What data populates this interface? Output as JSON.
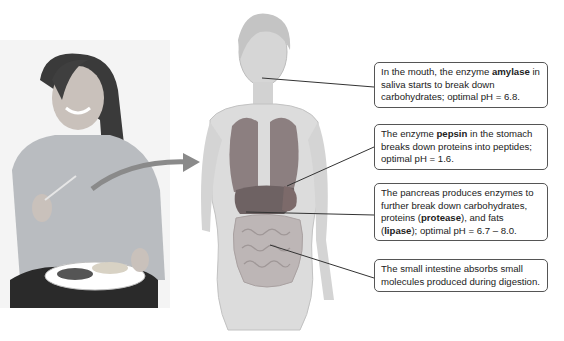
{
  "figure": {
    "arrow_color": "#8a8a8a",
    "leader_line_color": "#333333"
  },
  "callouts": [
    {
      "id": "mouth",
      "parts": [
        "In the mouth, the enzyme ",
        "amylase",
        " in saliva starts to break down carbohydrates; optimal pH = 6.8."
      ],
      "bold_index": [
        1
      ]
    },
    {
      "id": "stomach",
      "parts": [
        "The enzyme ",
        "pepsin",
        " in the stomach breaks down proteins into peptides; optimal pH = 1.6."
      ],
      "bold_index": [
        1
      ]
    },
    {
      "id": "pancreas",
      "parts": [
        "The pancreas produces enzymes to further break down carbohydrates, proteins (",
        "protease",
        "), and fats (",
        "lipase",
        "); optimal pH = 6.7 – 8.0."
      ],
      "bold_index": [
        1,
        3
      ]
    },
    {
      "id": "small-intestine",
      "parts": [
        "The small intestine absorbs small molecules produced during digestion."
      ],
      "bold_index": []
    }
  ]
}
